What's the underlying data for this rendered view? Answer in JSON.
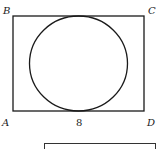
{
  "figure": {
    "vertices": {
      "A": {
        "label": "A",
        "x": 13,
        "y": 111
      },
      "B": {
        "label": "B",
        "x": 13,
        "y": 16
      },
      "C": {
        "label": "C",
        "x": 144,
        "y": 16
      },
      "D": {
        "label": "D",
        "x": 144,
        "y": 111
      }
    },
    "bottom_side_length_label": "8",
    "circle": {
      "cx": 78.5,
      "cy": 63.5,
      "rx": 49,
      "ry": 47.5
    },
    "stroke_color": "#1a1a1a",
    "answer_box": {
      "x": 44,
      "y": 143,
      "width": 111,
      "height": 12
    }
  }
}
